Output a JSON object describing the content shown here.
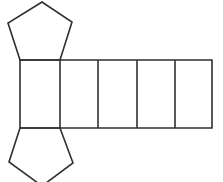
{
  "diagram": {
    "kind": "geometric-net",
    "shape": "pentagonal-prism-net",
    "background_color": "#ffffff",
    "stroke_color": "#2f2f2f",
    "stroke_width": 1.6,
    "canvas": {
      "width": 223,
      "height": 182
    },
    "rectangle_strip": {
      "count": 5,
      "x_lines": [
        20,
        60,
        98,
        137,
        175,
        212
      ],
      "y_top": 60,
      "y_bottom": 128
    },
    "top_pentagon": {
      "points": [
        [
          20,
          60
        ],
        [
          8,
          23
        ],
        [
          42,
          2
        ],
        [
          72,
          22
        ],
        [
          60,
          60
        ]
      ]
    },
    "bottom_pentagon": {
      "points": [
        [
          20,
          128
        ],
        [
          9,
          162
        ],
        [
          42,
          186
        ],
        [
          73,
          163
        ],
        [
          60,
          128
        ]
      ],
      "note": "apex clipped by bottom edge of canvas"
    }
  }
}
